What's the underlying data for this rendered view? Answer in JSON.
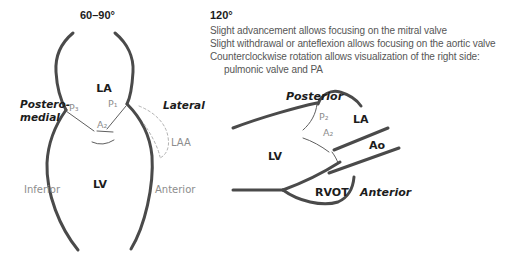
{
  "left_panel": {
    "angle": "60–90°",
    "labels": {
      "la": "LA",
      "lv": "LV",
      "p3": "P₃",
      "p1": "P₁",
      "a2": "A₂",
      "laa": "LAA",
      "postero_line1": "Postero-",
      "postero_line2": "medial",
      "lateral": "Lateral",
      "inferior": "Inferior",
      "anterior": "Anterior"
    }
  },
  "right_panel": {
    "angle": "120°",
    "notes": [
      "Slight advancement allows focusing on the mitral valve",
      "Slight withdrawal or anteflexion allows focusing on the aortic valve",
      "Counterclockwise rotation allows visualization of the right side:",
      "pulmonic valve and PA"
    ],
    "labels": {
      "posterior": "Posterior",
      "p2": "P₂",
      "a2": "A₂",
      "la": "LA",
      "ao": "Ao",
      "lv": "LV",
      "rvot": "RVOT",
      "anterior": "Anterior"
    }
  },
  "colors": {
    "wall_stroke": "#4a4a4a",
    "thin_stroke": "#5f5f5f",
    "dashed_stroke": "#b3b3b3",
    "label_dark": "#1c1c1c",
    "label_gray": "#8d8d8d",
    "notes_text": "#565656",
    "background": "#ffffff"
  }
}
